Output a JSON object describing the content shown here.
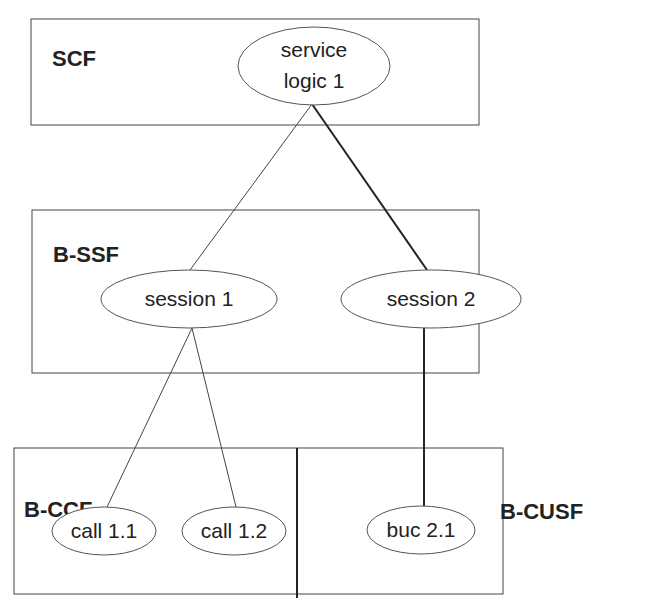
{
  "diagram": {
    "containers": [
      {
        "id": "scf",
        "label": "SCF"
      },
      {
        "id": "bssf",
        "label": "B-SSF"
      },
      {
        "id": "bccf",
        "label": "B-CCF"
      },
      {
        "id": "bcusf",
        "label": "B-CUSF"
      }
    ],
    "nodes": {
      "service_logic_1": {
        "line1": "service",
        "line2": "logic 1",
        "container": "SCF"
      },
      "session_1": {
        "label": "session 1",
        "container": "B-SSF"
      },
      "session_2": {
        "label": "session 2",
        "container": "B-SSF"
      },
      "call_1_1": {
        "label": "call 1.1",
        "container": "B-CCF"
      },
      "call_1_2": {
        "label": "call 1.2",
        "container": "B-CCF"
      },
      "buc_2_1": {
        "label": "buc 2.1",
        "container": "B-CUSF"
      }
    },
    "edges": [
      {
        "from": "service logic 1",
        "to": "session 1",
        "weight": "thin"
      },
      {
        "from": "service logic 1",
        "to": "session 2",
        "weight": "thick"
      },
      {
        "from": "session 1",
        "to": "call 1.1",
        "weight": "thin"
      },
      {
        "from": "session 1",
        "to": "call 1.2",
        "weight": "thin"
      },
      {
        "from": "session 2",
        "to": "buc 2.1",
        "weight": "thick"
      }
    ]
  }
}
